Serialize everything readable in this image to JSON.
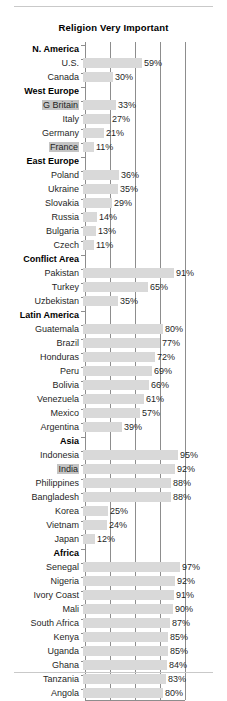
{
  "chart_data": {
    "type": "bar",
    "orientation": "horizontal",
    "title": "Religion Very Important",
    "xlabel": "",
    "ylabel": "",
    "xlim": [
      0,
      100
    ],
    "value_suffix": "%",
    "grid": true,
    "gridlines": [
      25,
      50,
      75,
      100
    ],
    "legend": "none",
    "categories": [
      "N. America",
      "U.S.",
      "Canada",
      "West Europe",
      "G Britain",
      "Italy",
      "Germany",
      "France",
      "East Europe",
      "Poland",
      "Ukraine",
      "Slovakia",
      "Russia",
      "Bulgaria",
      "Czech",
      "Conflict Area",
      "Pakistan",
      "Turkey",
      "Uzbekistan",
      "Latin America",
      "Guatemala",
      "Brazil",
      "Honduras",
      "Peru",
      "Bolivia",
      "Venezuela",
      "Mexico",
      "Argentina",
      "Asia",
      "Indonesia",
      "India",
      "Philippines",
      "Bangladesh",
      "Korea",
      "Vietnam",
      "Japan",
      "Africa",
      "Senegal",
      "Nigeria",
      "Ivory Coast",
      "Mali",
      "South Africa",
      "Kenya",
      "Uganda",
      "Ghana",
      "Tanzania",
      "Angola"
    ],
    "values": [
      null,
      59,
      30,
      null,
      33,
      27,
      21,
      11,
      null,
      36,
      35,
      29,
      14,
      13,
      11,
      null,
      91,
      65,
      35,
      null,
      80,
      77,
      72,
      69,
      66,
      61,
      57,
      39,
      null,
      95,
      92,
      88,
      88,
      25,
      24,
      12,
      null,
      97,
      92,
      91,
      90,
      87,
      85,
      85,
      84,
      83,
      80
    ],
    "rows": [
      {
        "label": "N. America",
        "value": null,
        "header": true,
        "highlight": false
      },
      {
        "label": "U.S.",
        "value": 59,
        "header": false,
        "highlight": false
      },
      {
        "label": "Canada",
        "value": 30,
        "header": false,
        "highlight": false
      },
      {
        "label": "West Europe",
        "value": null,
        "header": true,
        "highlight": false
      },
      {
        "label": "G Britain",
        "value": 33,
        "header": false,
        "highlight": true
      },
      {
        "label": "Italy",
        "value": 27,
        "header": false,
        "highlight": false
      },
      {
        "label": "Germany",
        "value": 21,
        "header": false,
        "highlight": false
      },
      {
        "label": "France",
        "value": 11,
        "header": false,
        "highlight": true
      },
      {
        "label": "East Europe",
        "value": null,
        "header": true,
        "highlight": false
      },
      {
        "label": "Poland",
        "value": 36,
        "header": false,
        "highlight": false
      },
      {
        "label": "Ukraine",
        "value": 35,
        "header": false,
        "highlight": false
      },
      {
        "label": "Slovakia",
        "value": 29,
        "header": false,
        "highlight": false
      },
      {
        "label": "Russia",
        "value": 14,
        "header": false,
        "highlight": false
      },
      {
        "label": "Bulgaria",
        "value": 13,
        "header": false,
        "highlight": false
      },
      {
        "label": "Czech",
        "value": 11,
        "header": false,
        "highlight": false
      },
      {
        "label": "Conflict Area",
        "value": null,
        "header": true,
        "highlight": false
      },
      {
        "label": "Pakistan",
        "value": 91,
        "header": false,
        "highlight": false
      },
      {
        "label": "Turkey",
        "value": 65,
        "header": false,
        "highlight": false
      },
      {
        "label": "Uzbekistan",
        "value": 35,
        "header": false,
        "highlight": false
      },
      {
        "label": "Latin America",
        "value": null,
        "header": true,
        "highlight": false
      },
      {
        "label": "Guatemala",
        "value": 80,
        "header": false,
        "highlight": false
      },
      {
        "label": "Brazil",
        "value": 77,
        "header": false,
        "highlight": false
      },
      {
        "label": "Honduras",
        "value": 72,
        "header": false,
        "highlight": false
      },
      {
        "label": "Peru",
        "value": 69,
        "header": false,
        "highlight": false
      },
      {
        "label": "Bolivia",
        "value": 66,
        "header": false,
        "highlight": false
      },
      {
        "label": "Venezuela",
        "value": 61,
        "header": false,
        "highlight": false
      },
      {
        "label": "Mexico",
        "value": 57,
        "header": false,
        "highlight": false
      },
      {
        "label": "Argentina",
        "value": 39,
        "header": false,
        "highlight": false
      },
      {
        "label": "Asia",
        "value": null,
        "header": true,
        "highlight": false
      },
      {
        "label": "Indonesia",
        "value": 95,
        "header": false,
        "highlight": false
      },
      {
        "label": "India",
        "value": 92,
        "header": false,
        "highlight": true
      },
      {
        "label": "Philippines",
        "value": 88,
        "header": false,
        "highlight": false
      },
      {
        "label": "Bangladesh",
        "value": 88,
        "header": false,
        "highlight": false
      },
      {
        "label": "Korea",
        "value": 25,
        "header": false,
        "highlight": false
      },
      {
        "label": "Vietnam",
        "value": 24,
        "header": false,
        "highlight": false
      },
      {
        "label": "Japan",
        "value": 12,
        "header": false,
        "highlight": false
      },
      {
        "label": "Africa",
        "value": null,
        "header": true,
        "highlight": false
      },
      {
        "label": "Senegal",
        "value": 97,
        "header": false,
        "highlight": false
      },
      {
        "label": "Nigeria",
        "value": 92,
        "header": false,
        "highlight": false
      },
      {
        "label": "Ivory Coast",
        "value": 91,
        "header": false,
        "highlight": false
      },
      {
        "label": "Mali",
        "value": 90,
        "header": false,
        "highlight": false
      },
      {
        "label": "South Africa",
        "value": 87,
        "header": false,
        "highlight": false
      },
      {
        "label": "Kenya",
        "value": 85,
        "header": false,
        "highlight": false
      },
      {
        "label": "Uganda",
        "value": 85,
        "header": false,
        "highlight": false
      },
      {
        "label": "Ghana",
        "value": 84,
        "header": false,
        "highlight": false
      },
      {
        "label": "Tanzania",
        "value": 83,
        "header": false,
        "highlight": false
      },
      {
        "label": "Angola",
        "value": 80,
        "header": false,
        "highlight": false
      }
    ]
  },
  "style": {
    "bar_color": "#d9d9d9",
    "axis_color": "#8d8d8d",
    "rule_color": "#c9c9c9",
    "text_color": "#1f1f1f",
    "highlight_color": "#c4c4c4"
  }
}
